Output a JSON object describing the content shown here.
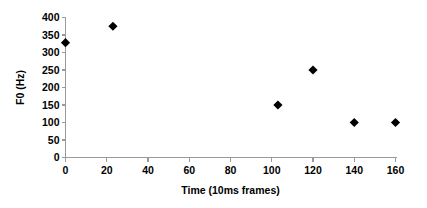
{
  "chart_data": {
    "type": "scatter",
    "title": "",
    "xlabel": "Time (10ms frames)",
    "ylabel": "F0 (Hz)",
    "xlim": [
      0,
      160
    ],
    "ylim": [
      0,
      400
    ],
    "xticks": [
      0,
      20,
      40,
      60,
      80,
      100,
      120,
      140,
      160
    ],
    "yticks": [
      0,
      50,
      100,
      150,
      200,
      250,
      300,
      350,
      400
    ],
    "xtick_labels": [
      "0",
      "20",
      "40",
      "60",
      "80",
      "100",
      "120",
      "140",
      "160"
    ],
    "ytick_labels": [
      "0",
      "50",
      "100",
      "150",
      "200",
      "250",
      "300",
      "350",
      "400"
    ],
    "grid": false,
    "legend": false,
    "marker_shape": "diamond",
    "marker_color": "#000000",
    "axis_color": "#9a9a9a",
    "series": [
      {
        "name": "F0",
        "points": [
          {
            "x": 0,
            "y": 328
          },
          {
            "x": 23,
            "y": 375
          },
          {
            "x": 103,
            "y": 150
          },
          {
            "x": 120,
            "y": 250
          },
          {
            "x": 140,
            "y": 100
          },
          {
            "x": 160,
            "y": 100
          }
        ]
      }
    ]
  }
}
